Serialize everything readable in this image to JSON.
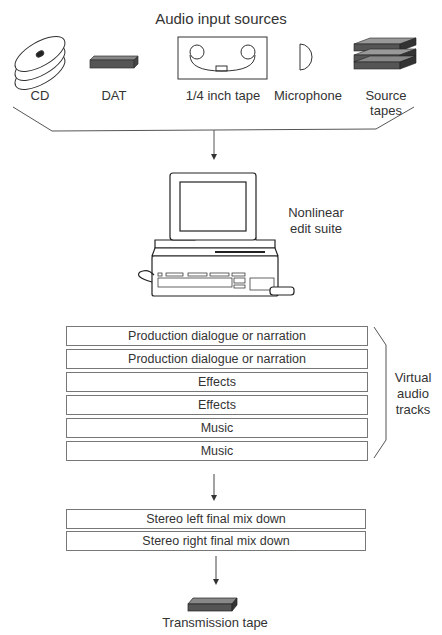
{
  "diagram": {
    "title": "Audio input sources",
    "sources": [
      {
        "id": "cd",
        "label": "CD",
        "icon": "cd-discs-icon"
      },
      {
        "id": "dat",
        "label": "DAT",
        "icon": "dat-cassette-icon"
      },
      {
        "id": "quarter-inch",
        "label": "1/4 inch tape",
        "icon": "reel-tape-icon"
      },
      {
        "id": "microphone",
        "label": "Microphone",
        "icon": "microphone-icon"
      },
      {
        "id": "source-tapes",
        "label_line1": "Source",
        "label_line2": "tapes",
        "icon": "tape-stack-icon"
      }
    ],
    "edit_suite": {
      "label_line1": "Nonlinear",
      "label_line2": "edit suite",
      "icon": "computer-workstation-icon"
    },
    "virtual_tracks": {
      "label_line1": "Virtual",
      "label_line2": "audio",
      "label_line3": "tracks",
      "tracks": [
        "Production dialogue or narration",
        "Production dialogue or narration",
        "Effects",
        "Effects",
        "Music",
        "Music"
      ]
    },
    "mixdown": [
      "Stereo left final mix down",
      "Stereo right final mix down"
    ],
    "output": {
      "label": "Transmission tape",
      "icon": "transmission-tape-icon"
    }
  }
}
